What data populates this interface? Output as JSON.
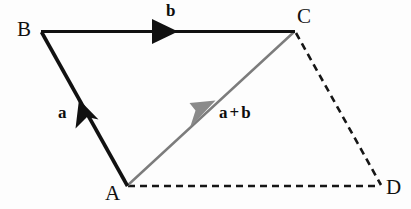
{
  "diagram": {
    "background_color": "#fdfdfd",
    "vertices": [
      {
        "id": "B",
        "label": "B",
        "x": 41,
        "y": 32
      },
      {
        "id": "C",
        "label": "C",
        "x": 295,
        "y": 31
      },
      {
        "id": "A",
        "label": "A",
        "x": 127,
        "y": 186
      },
      {
        "id": "D",
        "label": "D",
        "x": 382,
        "y": 186
      }
    ],
    "vector_labels": {
      "a": "a",
      "b": "b",
      "sum_left": "a",
      "sum_operator": "+",
      "sum_right": "b"
    },
    "edges": [
      {
        "id": "AB",
        "from": "A",
        "to": "B",
        "style": "solid",
        "color": "#111111",
        "width": 3.4,
        "arrow": true,
        "arrow_t": 0.55
      },
      {
        "id": "BC",
        "from": "B",
        "to": "C",
        "style": "solid",
        "color": "#111111",
        "width": 3.2,
        "arrow": true,
        "arrow_t": 0.5
      },
      {
        "id": "AC",
        "from": "A",
        "to": "C",
        "style": "solid",
        "color": "#7c7c7c",
        "width": 2.4,
        "arrow": true,
        "arrow_t": 0.4
      },
      {
        "id": "AD",
        "from": "A",
        "to": "D",
        "style": "dashed",
        "color": "#161616",
        "width": 2.6,
        "arrow": false,
        "dash": "7 5"
      },
      {
        "id": "CD",
        "from": "C",
        "to": "D",
        "style": "dashed",
        "color": "#161616",
        "width": 2.6,
        "arrow": false,
        "dash": "7 5"
      }
    ],
    "colors": {
      "black": "#111111",
      "gray": "#7c7c7c",
      "dashed": "#161616"
    }
  }
}
